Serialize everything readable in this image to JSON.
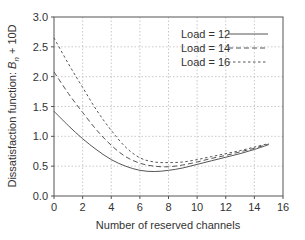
{
  "chart_data": {
    "type": "line",
    "title": "",
    "xlabel": "Number of reserved channels",
    "ylabel": "Dissatisfaction function: B_n + 10D",
    "ylabel_parts": {
      "prefix": "Dissatisfaction function: ",
      "var": "B",
      "sub": "n",
      "suffix": " + 10D"
    },
    "xlim": [
      0,
      16
    ],
    "ylim": [
      0.0,
      3.0
    ],
    "xticks": [
      0,
      2,
      4,
      6,
      8,
      10,
      12,
      14,
      16
    ],
    "yticks": [
      0.0,
      0.5,
      1.0,
      1.5,
      2.0,
      2.5,
      3.0
    ],
    "xtick_labels": [
      "0",
      "2",
      "4",
      "6",
      "8",
      "10",
      "12",
      "14",
      "16"
    ],
    "ytick_labels": [
      "0.0",
      "0.5",
      "1.0",
      "1.5",
      "2.0",
      "2.5",
      "3.0"
    ],
    "grid": true,
    "legend_position": "upper right",
    "x": [
      0,
      1,
      2,
      3,
      4,
      5,
      6,
      7,
      8,
      9,
      10,
      11,
      12,
      13,
      14,
      15
    ],
    "series": [
      {
        "name": "Load = 12",
        "style": "solid",
        "values": [
          1.42,
          1.18,
          0.96,
          0.77,
          0.61,
          0.5,
          0.43,
          0.41,
          0.43,
          0.47,
          0.53,
          0.59,
          0.65,
          0.71,
          0.78,
          0.86
        ]
      },
      {
        "name": "Load = 14",
        "style": "dashed",
        "values": [
          2.08,
          1.72,
          1.4,
          1.1,
          0.85,
          0.66,
          0.55,
          0.5,
          0.49,
          0.52,
          0.57,
          0.63,
          0.68,
          0.74,
          0.8,
          0.87
        ]
      },
      {
        "name": "Load = 16",
        "style": "dotted",
        "values": [
          2.65,
          2.22,
          1.82,
          1.43,
          1.1,
          0.82,
          0.64,
          0.57,
          0.56,
          0.57,
          0.61,
          0.66,
          0.71,
          0.76,
          0.82,
          0.88
        ]
      }
    ]
  }
}
